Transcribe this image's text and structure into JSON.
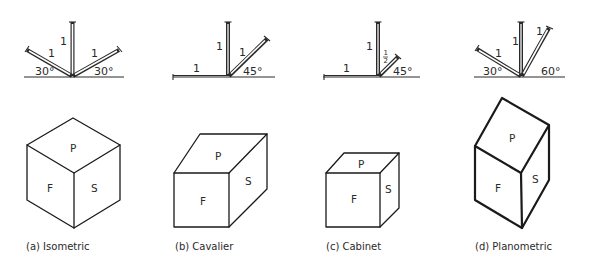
{
  "figure": {
    "panels": [
      {
        "id": "a",
        "caption": "(a) Isometric",
        "axes": {
          "lengths": {
            "left": "1",
            "vertical": "1",
            "right": "1"
          },
          "angles": {
            "left": "30°",
            "right": "30°"
          }
        },
        "faces": {
          "top": "P",
          "front": "F",
          "side": "S"
        }
      },
      {
        "id": "b",
        "caption": "(b) Cavalier",
        "axes": {
          "lengths": {
            "horizontal": "1",
            "vertical": "1",
            "receding": "1"
          },
          "angles": {
            "receding": "45°"
          }
        },
        "faces": {
          "top": "P",
          "front": "F",
          "side": "S"
        }
      },
      {
        "id": "c",
        "caption": "(c) Cabinet",
        "axes": {
          "lengths": {
            "horizontal": "1",
            "vertical": "1",
            "receding_num": "1",
            "receding_den": "2"
          },
          "angles": {
            "receding": "45°"
          }
        },
        "faces": {
          "top": "P",
          "front": "F",
          "side": "S"
        }
      },
      {
        "id": "d",
        "caption": "(d) Planometric",
        "axes": {
          "lengths": {
            "left": "1",
            "vertical": "1",
            "right": "1"
          },
          "angles": {
            "left": "30°",
            "right": "60°"
          }
        },
        "faces": {
          "top": "P",
          "front": "F",
          "side": "S"
        }
      }
    ]
  },
  "colors": {
    "ink": "#1a1a1a",
    "background": "#ffffff"
  }
}
